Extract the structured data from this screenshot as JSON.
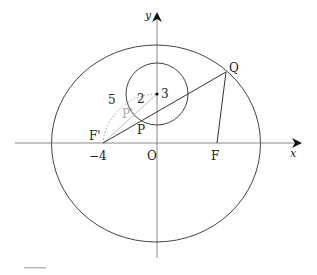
{
  "diagram": {
    "type": "geometry-ellipse-circle",
    "axes": {
      "x_label": "x",
      "y_label": "y"
    },
    "points": {
      "origin": "O",
      "left_focus": "F'",
      "right_focus": "F",
      "point_on_circle": "P",
      "point_on_circle_gray": "P'",
      "point_on_ellipse": "Q",
      "circle_center_label": "3"
    },
    "tick_labels": {
      "x_neg4": "−4"
    },
    "lengths": {
      "radius": "2",
      "distance_focus_to_center": "5"
    },
    "colors": {
      "stroke": "#333333",
      "gray": "#a8a8a8",
      "background": "#ffffff"
    }
  }
}
